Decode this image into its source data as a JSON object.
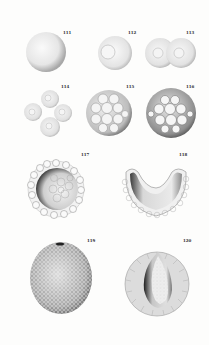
{
  "plate": {
    "background": "#fdfdfc",
    "ink": "#2a2a2a",
    "figures": [
      {
        "id": "111",
        "label": "111",
        "description": "undivided egg cell (sphere)"
      },
      {
        "id": "112",
        "label": "112",
        "description": "egg with nucleus"
      },
      {
        "id": "113",
        "label": "113",
        "description": "two-cell stage"
      },
      {
        "id": "114",
        "label": "114",
        "description": "four-cell stage"
      },
      {
        "id": "115",
        "label": "115",
        "description": "morula"
      },
      {
        "id": "116",
        "label": "116",
        "description": "advanced morula"
      },
      {
        "id": "117",
        "label": "117",
        "description": "blastula section"
      },
      {
        "id": "118",
        "label": "118",
        "description": "invaginating gastrula section"
      },
      {
        "id": "119",
        "label": "119",
        "description": "gastrula exterior"
      },
      {
        "id": "120",
        "label": "120",
        "description": "gastrula section"
      }
    ]
  }
}
